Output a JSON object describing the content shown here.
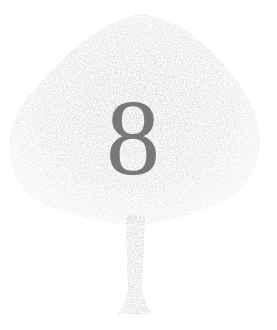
{
  "image": {
    "description": "Pale, grainy silhouette of a tree with a large gray numeral in the center of its canopy",
    "numeral": "8",
    "colors": {
      "background": "#ffffff",
      "canopy": "#e4e4e4",
      "canopy_shade": "#d8d8d8",
      "trunk": "#e6e6e6",
      "numeral": "#787878"
    }
  }
}
